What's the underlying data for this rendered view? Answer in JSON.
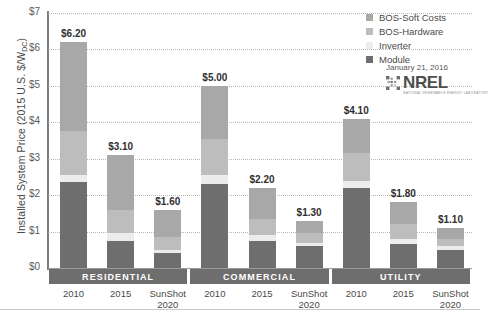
{
  "chart_data": {
    "type": "bar",
    "subtype": "stacked-bar-grouped",
    "title": "",
    "xlabel": "",
    "ylabel": "Installed System Price (2015 U.S. $/W",
    "ylabel_sub": "DC",
    "ylabel_suffix": ")",
    "ylim": [
      0,
      7
    ],
    "ytick_labels": [
      "$0",
      "$1",
      "$2",
      "$3",
      "$4",
      "$5",
      "$6",
      "$7"
    ],
    "ytick_values": [
      0,
      1,
      2,
      3,
      4,
      5,
      6,
      7
    ],
    "grid": true,
    "legend_position": "top-right",
    "series": [
      {
        "name": "BOS-Soft Costs",
        "color": "#a8a8a8",
        "values": [
          2.45,
          1.5,
          0.75,
          1.45,
          0.85,
          0.35,
          0.95,
          0.6,
          0.3
        ]
      },
      {
        "name": "BOS-Hardware",
        "color": "#bdbdbd",
        "values": [
          1.2,
          0.65,
          0.35,
          1.0,
          0.45,
          0.25,
          0.75,
          0.4,
          0.2
        ]
      },
      {
        "name": "Inverter",
        "color": "#ececec",
        "values": [
          0.2,
          0.2,
          0.1,
          0.25,
          0.15,
          0.1,
          0.2,
          0.15,
          0.1
        ]
      },
      {
        "name": "Module",
        "color": "#6e6e6e",
        "values": [
          2.35,
          0.75,
          0.4,
          2.3,
          0.75,
          0.6,
          2.2,
          0.65,
          0.5
        ]
      }
    ],
    "categories": [
      {
        "group": "RESIDENTIAL",
        "label": "2010",
        "total": 6.2,
        "total_label": "$6.20"
      },
      {
        "group": "RESIDENTIAL",
        "label": "2015",
        "total": 3.1,
        "total_label": "$3.10"
      },
      {
        "group": "RESIDENTIAL",
        "label": "SunShot\n2020",
        "total": 1.6,
        "total_label": "$1.60"
      },
      {
        "group": "COMMERCIAL",
        "label": "2010",
        "total": 5.0,
        "total_label": "$5.00"
      },
      {
        "group": "COMMERCIAL",
        "label": "2015",
        "total": 2.2,
        "total_label": "$2.20"
      },
      {
        "group": "COMMERCIAL",
        "label": "SunShot\n2020",
        "total": 1.3,
        "total_label": "$1.30"
      },
      {
        "group": "UTILITY",
        "label": "2010",
        "total": 4.1,
        "total_label": "$4.10"
      },
      {
        "group": "UTILITY",
        "label": "2015",
        "total": 1.8,
        "total_label": "$1.80"
      },
      {
        "group": "UTILITY",
        "label": "SunShot\n2020",
        "total": 1.1,
        "total_label": "$1.10"
      }
    ],
    "groups": [
      {
        "name": "RESIDENTIAL",
        "start": 0,
        "count": 3
      },
      {
        "name": "COMMERCIAL",
        "start": 3,
        "count": 3
      },
      {
        "name": "UTILITY",
        "start": 6,
        "count": 3
      }
    ]
  },
  "legend": {
    "items": [
      {
        "label": "BOS-Soft Costs",
        "color": "#a8a8a8"
      },
      {
        "label": "BOS-Hardware",
        "color": "#bdbdbd"
      },
      {
        "label": "Inverter",
        "color": "#ececec"
      },
      {
        "label": "Module",
        "color": "#6e6e6e"
      }
    ]
  },
  "attribution": {
    "date": "January 21, 2016",
    "organization": "NREL",
    "tagline": "NATIONAL RENEWABLE ENERGY LABORATORY"
  },
  "colors": {
    "bos_soft": "#a8a8a8",
    "bos_hardware": "#bdbdbd",
    "inverter": "#ececec",
    "module": "#6e6e6e",
    "band": "#6e6e6e",
    "axis": "#7c7c7c",
    "grid": "#b9b9b9",
    "text": "#4a4a4a"
  }
}
